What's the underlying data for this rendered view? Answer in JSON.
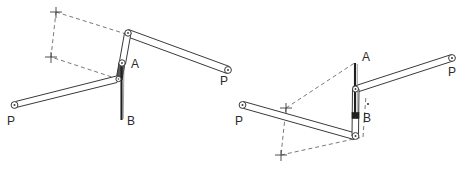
{
  "figure": {
    "background_color": "#ffffff",
    "stroke_color": "#3a3a3a",
    "dash_color": "#555555",
    "label_color": "#2b2b2b",
    "width": 467,
    "height": 171
  },
  "diagrams": [
    {
      "id": "left",
      "name": "linkage-position-1",
      "labels": {
        "point_a": "A",
        "point_b": "B",
        "pivot_left": "P",
        "pivot_right": "P"
      },
      "points": {
        "top_joint": [
          128,
          33
        ],
        "point_a_joint": [
          122,
          63
        ],
        "mid_joint": [
          118,
          79
        ],
        "right_pivot": [
          228,
          70
        ],
        "left_pivot": [
          14,
          105
        ],
        "b_end": [
          124,
          120
        ],
        "a_label": [
          131,
          65
        ],
        "b_label": [
          128,
          122
        ],
        "p_left_label": [
          10,
          122
        ],
        "p_right_label": [
          221,
          82
        ]
      },
      "dashed_quad": [
        [
          56,
          12
        ],
        [
          126,
          34
        ],
        [
          118,
          79
        ],
        [
          51,
          57
        ]
      ],
      "cross_markers": [
        [
          56,
          12
        ],
        [
          51,
          57
        ]
      ]
    },
    {
      "id": "right",
      "name": "linkage-position-2",
      "labels": {
        "point_a": "A",
        "point_b": "B",
        "pivot_left": "P",
        "pivot_right": "P"
      },
      "points": {
        "top_joint": [
          355,
          62
        ],
        "a_joint": [
          355,
          89
        ],
        "b_joint": [
          357,
          116
        ],
        "bottom_joint": [
          355,
          136
        ],
        "right_pivot": [
          452,
          58
        ],
        "left_pivot": [
          242,
          105
        ],
        "a_label": [
          363,
          57
        ],
        "b_label": [
          365,
          117
        ],
        "p_left_label": [
          238,
          122
        ],
        "p_right_label": [
          450,
          73
        ]
      },
      "dashed_quad": [
        [
          286,
          108
        ],
        [
          356,
          62
        ],
        [
          365,
          136
        ],
        [
          281,
          155
        ]
      ],
      "cross_markers": [
        [
          286,
          108
        ],
        [
          281,
          155
        ]
      ]
    }
  ]
}
